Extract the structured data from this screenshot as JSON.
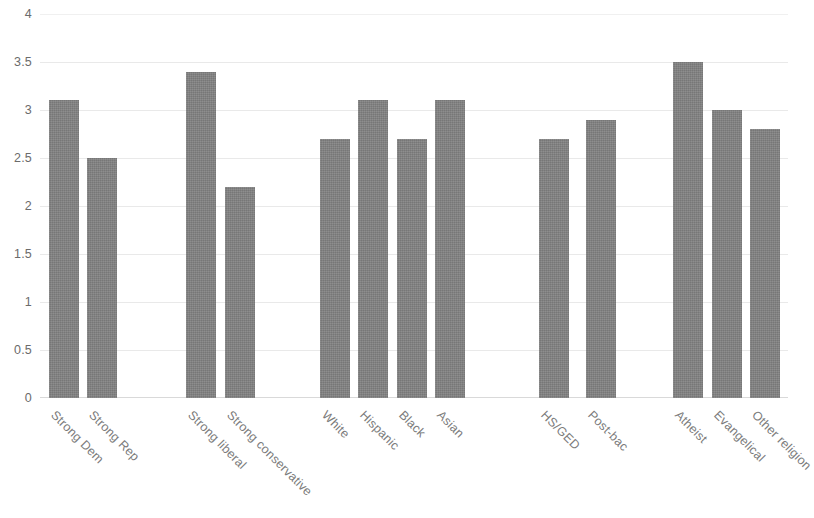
{
  "chart_data": {
    "type": "bar",
    "title": "",
    "subtitle": "",
    "xlabel": "",
    "ylabel": "",
    "ylim": [
      0,
      4
    ],
    "y_ticks": [
      "0",
      "0.5",
      "1",
      "1.5",
      "2",
      "2.5",
      "3",
      "3.5",
      "4"
    ],
    "y_tick_values": [
      0,
      0.5,
      1,
      1.5,
      2,
      2.5,
      3,
      3.5,
      4
    ],
    "grid": true,
    "legend": "none",
    "bar_color": "#818181",
    "gridline_color": "#e9e9e9",
    "tick_label_color": "#6b6b6b",
    "categories": [
      "Strong Dem",
      "Strong Rep",
      "Strong liberal",
      "Strong conservative",
      "White",
      "Hispanic",
      "Black",
      "Asian",
      "HS/GED",
      "Post-bac",
      "Atheist",
      "Evangelical",
      "Other religion"
    ],
    "values": [
      3.1,
      2.5,
      3.4,
      2.2,
      2.7,
      3.1,
      2.7,
      3.1,
      2.7,
      2.9,
      3.5,
      3.0,
      2.8
    ],
    "groups": [
      {
        "name": "party",
        "categories": [
          "Strong Dem",
          "Strong Rep"
        ]
      },
      {
        "name": "ideology",
        "categories": [
          "Strong liberal",
          "Strong conservative"
        ]
      },
      {
        "name": "race",
        "categories": [
          "White",
          "Hispanic",
          "Black",
          "Asian"
        ]
      },
      {
        "name": "education",
        "categories": [
          "HS/GED",
          "Post-bac"
        ]
      },
      {
        "name": "religion",
        "categories": [
          "Atheist",
          "Evangelical",
          "Other religion"
        ]
      }
    ],
    "bar_layout": [
      {
        "label": "Strong Dem",
        "value": 3.1,
        "x": 49,
        "width": 30
      },
      {
        "label": "Strong Rep",
        "value": 2.5,
        "x": 87,
        "width": 30
      },
      {
        "label": "Strong liberal",
        "value": 3.4,
        "x": 186,
        "width": 30
      },
      {
        "label": "Strong conservative",
        "value": 2.2,
        "x": 225,
        "width": 30
      },
      {
        "label": "White",
        "value": 2.7,
        "x": 320,
        "width": 30
      },
      {
        "label": "Hispanic",
        "value": 3.1,
        "x": 358,
        "width": 30
      },
      {
        "label": "Black",
        "value": 2.7,
        "x": 397,
        "width": 30
      },
      {
        "label": "Asian",
        "value": 3.1,
        "x": 435,
        "width": 30
      },
      {
        "label": "HS/GED",
        "value": 2.7,
        "x": 539,
        "width": 30
      },
      {
        "label": "Post-bac",
        "value": 2.9,
        "x": 586,
        "width": 30
      },
      {
        "label": "Atheist",
        "value": 3.5,
        "x": 673,
        "width": 30
      },
      {
        "label": "Evangelical",
        "value": 3.0,
        "x": 712,
        "width": 30
      },
      {
        "label": "Other religion",
        "value": 2.8,
        "x": 750,
        "width": 30
      }
    ],
    "axis_geometry": {
      "baseline_y": 398,
      "top_y": 14,
      "pixels_per_unit": 96,
      "plot_left": 40,
      "plot_right": 788
    }
  }
}
